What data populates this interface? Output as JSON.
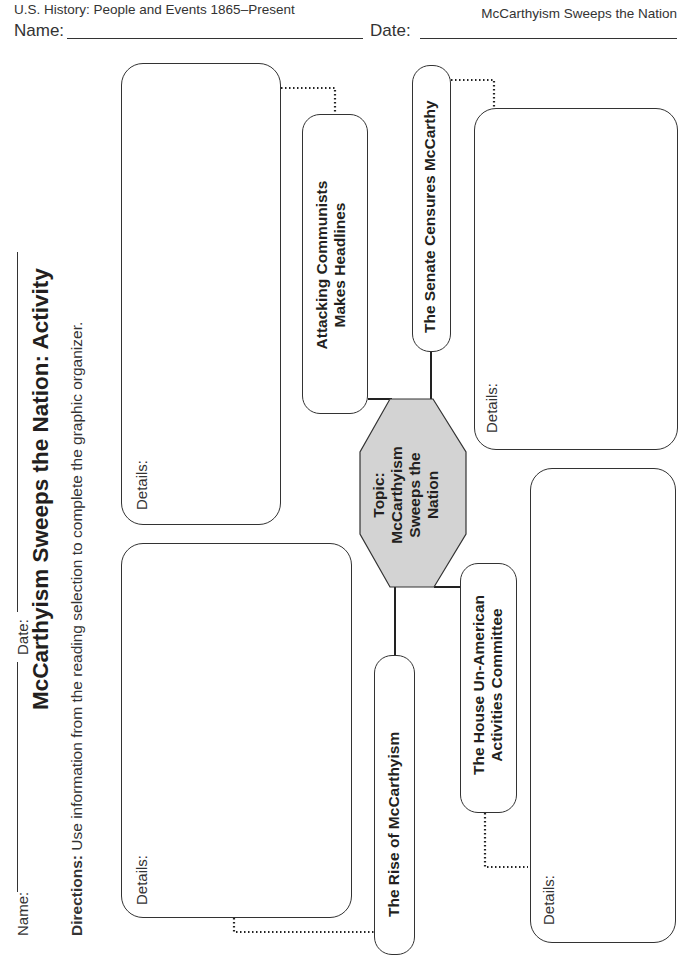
{
  "page_header": {
    "course": "U.S. History: People and Events 1865–Present",
    "unit": "McCarthyism Sweeps the Nation",
    "name_label": "Name:",
    "date_label": "Date:"
  },
  "rotated_header": {
    "name_label": "Name:",
    "date_label": "Date:",
    "title": "McCarthyism Sweeps the Nation: Activity",
    "directions_bold": "Directions:",
    "directions_text": " Use information from the reading selection to complete the graphic organizer."
  },
  "organizer": {
    "central_topic": {
      "line1": "Topic:",
      "line2": "McCarthyism",
      "line3": "Sweeps the",
      "line4": "Nation",
      "fill_color": "#d3d3d3"
    },
    "subtopics": [
      {
        "id": "attacking",
        "line1": "Attacking Communists",
        "line2": "Makes Headlines",
        "details_label": "Details:"
      },
      {
        "id": "senate",
        "line1": "The Senate Censures McCarthy",
        "details_label": "Details:"
      },
      {
        "id": "rise",
        "line1": "The Rise of McCarthyism",
        "details_label": "Details:"
      },
      {
        "id": "huac",
        "line1": "The House Un-American",
        "line2": "Activities Committee",
        "details_label": "Details:"
      }
    ]
  }
}
